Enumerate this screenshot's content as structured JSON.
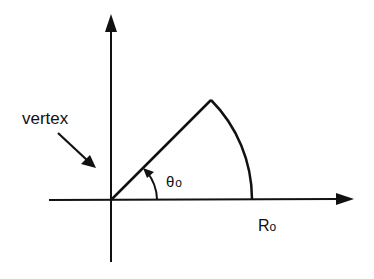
{
  "diagram": {
    "type": "polar-sector",
    "labels": {
      "vertex": "vertex",
      "angle_symbol": "θ",
      "angle_subscript": "o",
      "radius_symbol": "R",
      "radius_subscript": "o"
    },
    "geometry": {
      "origin": [
        111,
        200
      ],
      "radius_px": 141,
      "angle_deg": 45
    },
    "colors": {
      "stroke": "#111111",
      "background": "#ffffff"
    }
  }
}
